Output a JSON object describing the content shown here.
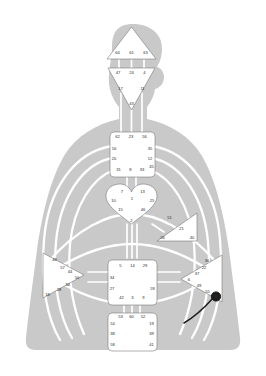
{
  "diagram": {
    "colors": {
      "silhouette": "#c9c9c9",
      "center_fill": "#ffffff",
      "center_stroke": "#6e6e6e",
      "channel": "#ffffff",
      "gate_text": "#2b2b2b",
      "activated": "#1d1d1d",
      "background": "#ffffff"
    }
  },
  "centers": [
    {
      "id": "head",
      "name": "Head Center",
      "shape": "triangle-up",
      "gates": [
        {
          "label": "64",
          "x": 117.5,
          "y": 52.5
        },
        {
          "label": "61",
          "x": 131.5,
          "y": 52.5
        },
        {
          "label": "63",
          "x": 145.5,
          "y": 52.5
        }
      ]
    },
    {
      "id": "ajna",
      "name": "Ajna Center",
      "shape": "triangle-down",
      "gates": [
        {
          "label": "47",
          "x": 118.0,
          "y": 73.0
        },
        {
          "label": "24",
          "x": 131.5,
          "y": 73.0
        },
        {
          "label": "4",
          "x": 144.5,
          "y": 73.0
        },
        {
          "label": "17",
          "x": 120.5,
          "y": 88.5
        },
        {
          "label": "11",
          "x": 142.5,
          "y": 88.5
        },
        {
          "label": "43",
          "x": 131.5,
          "y": 103.5
        }
      ]
    },
    {
      "id": "throat",
      "name": "Throat Center",
      "shape": "square",
      "gates": [
        {
          "label": "62",
          "x": 117.5,
          "y": 137.0
        },
        {
          "label": "23",
          "x": 131.0,
          "y": 137.0
        },
        {
          "label": "56",
          "x": 144.5,
          "y": 137.0
        },
        {
          "label": "16",
          "x": 114.0,
          "y": 148.5
        },
        {
          "label": "35",
          "x": 150.0,
          "y": 148.5
        },
        {
          "label": "20",
          "x": 114.0,
          "y": 159.0
        },
        {
          "label": "12",
          "x": 150.0,
          "y": 159.0
        },
        {
          "label": "31",
          "x": 118.5,
          "y": 170.0
        },
        {
          "label": "8",
          "x": 130.5,
          "y": 170.0
        },
        {
          "label": "33",
          "x": 142.0,
          "y": 170.0
        },
        {
          "label": "45",
          "x": 151.5,
          "y": 166.5
        }
      ]
    },
    {
      "id": "g",
      "name": "G Center (Identity)",
      "shape": "heart",
      "gates": [
        {
          "label": "7",
          "x": 122.0,
          "y": 192.0
        },
        {
          "label": "13",
          "x": 142.5,
          "y": 192.0
        },
        {
          "label": "10",
          "x": 113.5,
          "y": 200.5
        },
        {
          "label": "1",
          "x": 132.0,
          "y": 198.5
        },
        {
          "label": "25",
          "x": 152.0,
          "y": 200.5
        },
        {
          "label": "15",
          "x": 120.5,
          "y": 210.0
        },
        {
          "label": "46",
          "x": 143.0,
          "y": 210.0
        },
        {
          "label": "2",
          "x": 131.5,
          "y": 220.5
        }
      ]
    },
    {
      "id": "ego",
      "name": "Ego / Heart Center",
      "shape": "triangle-left",
      "gates": [
        {
          "label": "51",
          "x": 169.5,
          "y": 218.0
        },
        {
          "label": "21",
          "x": 181.5,
          "y": 228.5
        },
        {
          "label": "26",
          "x": 162.5,
          "y": 237.5
        },
        {
          "label": "40",
          "x": 192.0,
          "y": 237.5
        }
      ]
    },
    {
      "id": "spleen",
      "name": "Spleen Center",
      "shape": "triangle-right",
      "gates": [
        {
          "label": "48",
          "x": 54.5,
          "y": 260.0
        },
        {
          "label": "57",
          "x": 62.5,
          "y": 267.5
        },
        {
          "label": "44",
          "x": 70.0,
          "y": 272.0
        },
        {
          "label": "50",
          "x": 77.0,
          "y": 278.0
        },
        {
          "label": "32",
          "x": 67.5,
          "y": 285.0
        },
        {
          "label": "28",
          "x": 59.0,
          "y": 289.5
        },
        {
          "label": "18",
          "x": 47.5,
          "y": 294.5
        }
      ]
    },
    {
      "id": "sacral",
      "name": "Sacral Center",
      "shape": "square",
      "gates": [
        {
          "label": "5",
          "x": 120.5,
          "y": 266.0
        },
        {
          "label": "14",
          "x": 132.5,
          "y": 266.0
        },
        {
          "label": "29",
          "x": 145.0,
          "y": 266.0
        },
        {
          "label": "34",
          "x": 112.0,
          "y": 277.5
        },
        {
          "label": "27",
          "x": 112.0,
          "y": 288.5
        },
        {
          "label": "59",
          "x": 152.5,
          "y": 288.5
        },
        {
          "label": "42",
          "x": 121.5,
          "y": 298.0
        },
        {
          "label": "3",
          "x": 132.5,
          "y": 298.0
        },
        {
          "label": "9",
          "x": 143.5,
          "y": 298.0
        }
      ]
    },
    {
      "id": "solar-plexus",
      "name": "Solar Plexus Center",
      "shape": "triangle-left",
      "gates": [
        {
          "label": "36",
          "x": 207.0,
          "y": 260.5
        },
        {
          "label": "22",
          "x": 204.0,
          "y": 267.5
        },
        {
          "label": "37",
          "x": 197.0,
          "y": 273.5
        },
        {
          "label": "6",
          "x": 189.0,
          "y": 279.5
        },
        {
          "label": "49",
          "x": 199.0,
          "y": 285.5
        },
        {
          "label": "55",
          "x": 207.5,
          "y": 291.5
        },
        {
          "label": "30",
          "x": 216.0,
          "y": 296.5
        }
      ]
    },
    {
      "id": "root",
      "name": "Root Center",
      "shape": "square",
      "gates": [
        {
          "label": "53",
          "x": 120.5,
          "y": 317.0
        },
        {
          "label": "60",
          "x": 131.5,
          "y": 317.0
        },
        {
          "label": "52",
          "x": 143.0,
          "y": 317.0
        },
        {
          "label": "54",
          "x": 112.5,
          "y": 323.5
        },
        {
          "label": "19",
          "x": 151.5,
          "y": 323.5
        },
        {
          "label": "38",
          "x": 112.5,
          "y": 334.0
        },
        {
          "label": "39",
          "x": 151.5,
          "y": 334.0
        },
        {
          "label": "58",
          "x": 112.5,
          "y": 344.5
        },
        {
          "label": "41",
          "x": 151.5,
          "y": 344.5
        }
      ]
    }
  ],
  "activations": [
    {
      "gate": "30",
      "type": "filled-circle",
      "x": 216.0,
      "y": 296.5
    }
  ]
}
